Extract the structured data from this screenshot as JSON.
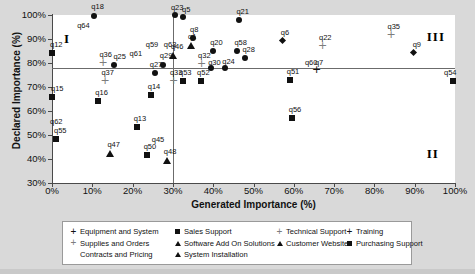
{
  "chart_data": {
    "type": "scatter",
    "title": "",
    "xlabel": "Generated Importance (%)",
    "ylabel": "Declared Importance (%)",
    "xlim": [
      0,
      100
    ],
    "ylim": [
      30,
      100
    ],
    "xticks": [
      "0%",
      "10%",
      "20%",
      "30%",
      "40%",
      "50%",
      "60%",
      "70%",
      "80%",
      "90%",
      "100%"
    ],
    "yticks": [
      "30%",
      "40%",
      "50%",
      "60%",
      "70%",
      "80%",
      "90%",
      "100%"
    ],
    "grid": false,
    "legend_position": "bottom",
    "reference_lines": {
      "vertical_x": 30,
      "horizontal_y": 78
    },
    "quadrant_labels": [
      {
        "text": "I",
        "x": 3,
        "y": 90
      },
      {
        "text": "II",
        "x": 93,
        "y": 42
      },
      {
        "text": "III",
        "x": 93,
        "y": 91
      }
    ],
    "series": [
      {
        "name": "Equipment and System",
        "marker": "diamond-black"
      },
      {
        "name": "Supplies and Orders Contracts and Pricing",
        "marker": "plus-gray"
      },
      {
        "name": "Sales Support",
        "marker": "square-black"
      },
      {
        "name": "Software Add On Solutions",
        "marker": "triangle-black"
      },
      {
        "name": "System Installation",
        "marker": "triangle-black"
      },
      {
        "name": "Technical Support",
        "marker": "plus-gray"
      },
      {
        "name": "Customer Website",
        "marker": "triangle-black"
      },
      {
        "name": "Training",
        "marker": "diamond-black"
      },
      {
        "name": "Purchasing Support",
        "marker": "square-black"
      }
    ],
    "points": [
      {
        "label": "q18",
        "x": 10.5,
        "y": 99.5,
        "marker": "circ",
        "lx": -3,
        "ly": -13
      },
      {
        "label": "q64",
        "x": 7.0,
        "y": 95.0,
        "marker": "none",
        "lx": -3,
        "ly": -5
      },
      {
        "label": "q12",
        "x": 0.0,
        "y": 84.0,
        "marker": "sq",
        "lx": -2,
        "ly": -12
      },
      {
        "label": "q36",
        "x": 12.5,
        "y": 80.0,
        "marker": "plus",
        "lx": -3,
        "ly": -12
      },
      {
        "label": "q25",
        "x": 15.5,
        "y": 79.0,
        "marker": "circ",
        "lx": -1,
        "ly": -12
      },
      {
        "label": "q61",
        "x": 20.0,
        "y": 83.5,
        "marker": "none",
        "lx": -3,
        "ly": -5
      },
      {
        "label": "q59",
        "x": 24.0,
        "y": 87.0,
        "marker": "none",
        "lx": -3,
        "ly": -5
      },
      {
        "label": "q63",
        "x": 28.5,
        "y": 87.0,
        "marker": "none",
        "lx": -3,
        "ly": -5
      },
      {
        "label": "q46",
        "x": 30.0,
        "y": 83.0,
        "marker": "tri",
        "lx": -2,
        "ly": -13
      },
      {
        "label": "q29",
        "x": 27.5,
        "y": 79.0,
        "marker": "circ",
        "lx": -3,
        "ly": -13
      },
      {
        "label": "q27",
        "x": 25.5,
        "y": 76.0,
        "marker": "circ",
        "lx": -5,
        "ly": -12
      },
      {
        "label": "q33",
        "x": 30.0,
        "y": 72.5,
        "marker": "plus",
        "lx": -3,
        "ly": -12
      },
      {
        "label": "q37",
        "x": 13.0,
        "y": 72.5,
        "marker": "plus",
        "lx": -3,
        "ly": -12
      },
      {
        "label": "q15",
        "x": 0.0,
        "y": 66.0,
        "marker": "sq",
        "lx": -1,
        "ly": -12
      },
      {
        "label": "q16",
        "x": 11.5,
        "y": 64.0,
        "marker": "sq",
        "lx": -3,
        "ly": -12
      },
      {
        "label": "q14",
        "x": 24.5,
        "y": 66.5,
        "marker": "sq",
        "lx": -3,
        "ly": -12
      },
      {
        "label": "q62",
        "x": 0.0,
        "y": 55.0,
        "marker": "none",
        "lx": -2,
        "ly": -5
      },
      {
        "label": "q13",
        "x": 21.0,
        "y": 53.5,
        "marker": "sq",
        "lx": -3,
        "ly": -12
      },
      {
        "label": "q55",
        "x": 1.0,
        "y": 48.5,
        "marker": "sq",
        "lx": -2,
        "ly": -12
      },
      {
        "label": "q45",
        "x": 25.5,
        "y": 47.5,
        "marker": "none",
        "lx": -3,
        "ly": -5
      },
      {
        "label": "q47",
        "x": 14.5,
        "y": 42.5,
        "marker": "tri",
        "lx": -3,
        "ly": -12
      },
      {
        "label": "q50",
        "x": 23.5,
        "y": 41.5,
        "marker": "sq",
        "lx": -3,
        "ly": -12
      },
      {
        "label": "q48",
        "x": 28.5,
        "y": 39.5,
        "marker": "tri",
        "lx": -3,
        "ly": -12
      },
      {
        "label": "q23",
        "x": 30.5,
        "y": 100.0,
        "marker": "circ",
        "lx": -4,
        "ly": -11
      },
      {
        "label": "q5",
        "x": 32.5,
        "y": 99.0,
        "marker": "circ",
        "lx": -1,
        "ly": -11
      },
      {
        "label": "q21",
        "x": 46.5,
        "y": 98.0,
        "marker": "circ",
        "lx": -3,
        "ly": -12
      },
      {
        "label": "q8",
        "x": 35.0,
        "y": 90.5,
        "marker": "circ",
        "lx": -3,
        "ly": -12
      },
      {
        "label": "q1",
        "x": 34.5,
        "y": 87.5,
        "marker": "tri",
        "lx": -3,
        "ly": -12
      },
      {
        "label": "q20",
        "x": 40.0,
        "y": 85.0,
        "marker": "circ",
        "lx": -3,
        "ly": -12
      },
      {
        "label": "q58",
        "x": 46.0,
        "y": 85.0,
        "marker": "circ",
        "lx": -3,
        "ly": -12
      },
      {
        "label": "q28",
        "x": 48.0,
        "y": 82.0,
        "marker": "circ",
        "lx": -3,
        "ly": -12
      },
      {
        "label": "q32",
        "x": 37.0,
        "y": 79.5,
        "marker": "plus",
        "lx": -3,
        "ly": -12
      },
      {
        "label": "q30",
        "x": 39.5,
        "y": 78.0,
        "marker": "circ",
        "lx": -3,
        "ly": -9
      },
      {
        "label": "q24",
        "x": 43.0,
        "y": 78.0,
        "marker": "circ",
        "lx": -3,
        "ly": -10
      },
      {
        "label": "q53",
        "x": 32.5,
        "y": 72.5,
        "marker": "sq",
        "lx": -4,
        "ly": -12
      },
      {
        "label": "q52",
        "x": 37.0,
        "y": 72.5,
        "marker": "sq",
        "lx": -4,
        "ly": -12
      },
      {
        "label": "q6",
        "x": 57.5,
        "y": 89.0,
        "marker": "dia",
        "lx": -3,
        "ly": -12
      },
      {
        "label": "q22",
        "x": 67.0,
        "y": 87.0,
        "marker": "plus",
        "lx": -3,
        "ly": -12
      },
      {
        "label": "q35",
        "x": 84.0,
        "y": 91.5,
        "marker": "plus",
        "lx": -3,
        "ly": -12
      },
      {
        "label": "q9",
        "x": 90.0,
        "y": 84.0,
        "marker": "dia",
        "lx": -2,
        "ly": -12
      },
      {
        "label": "q60",
        "x": 64.0,
        "y": 78.0,
        "marker": "none",
        "lx": -5,
        "ly": -9
      },
      {
        "label": "q7",
        "x": 65.5,
        "y": 77.0,
        "marker": "plusk",
        "lx": -1,
        "ly": -11
      },
      {
        "label": "q51",
        "x": 59.0,
        "y": 73.0,
        "marker": "sq",
        "lx": -3,
        "ly": -12
      },
      {
        "label": "q54",
        "x": 99.5,
        "y": 72.5,
        "marker": "sq",
        "lx": -9,
        "ly": -12
      },
      {
        "label": "q56",
        "x": 59.5,
        "y": 57.0,
        "marker": "sq",
        "lx": -3,
        "ly": -12
      }
    ]
  },
  "axes": {
    "y_title": "Declared Importance (%)",
    "x_title": "Generated Importance (%)"
  },
  "legend": {
    "columns": [
      {
        "left": 6,
        "items": [
          {
            "marker": "plusk",
            "label": "Equipment and System"
          },
          {
            "marker": "plus",
            "label": "Supplies and Orders"
          },
          {
            "marker": "none",
            "label": "Contracts and Pricing"
          }
        ]
      },
      {
        "left": 110,
        "items": [
          {
            "marker": "sq",
            "label": "Sales Support"
          },
          {
            "marker": "tri",
            "label": "Software Add On Solutions"
          },
          {
            "marker": "tri",
            "label": "System Installation"
          }
        ]
      },
      {
        "left": 212,
        "items": [
          {
            "marker": "plus",
            "label": "Technical Support"
          },
          {
            "marker": "tri",
            "label": "Customer Website"
          }
        ]
      },
      {
        "left": 282,
        "items": [
          {
            "marker": "plusk",
            "label": "Training"
          },
          {
            "marker": "sq",
            "label": "Purchasing Support"
          }
        ]
      }
    ]
  }
}
